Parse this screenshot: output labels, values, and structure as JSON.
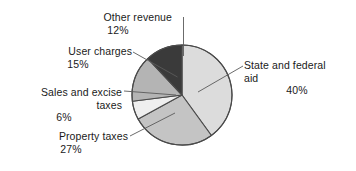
{
  "chart_data": {
    "type": "pie",
    "title": "",
    "subtitle": "",
    "xlabel": "",
    "ylabel": "",
    "legend_position": "none",
    "labels_position": "outside-with-leader-lines",
    "start_angle_deg": 0,
    "direction": "clockwise",
    "units": "percent",
    "categories": [
      "State and federal aid",
      "Property taxes",
      "Sales and excise taxes",
      "User charges",
      "Other revenue"
    ],
    "values": [
      40,
      27,
      6,
      15,
      12
    ],
    "slices": [
      {
        "name": "State and federal aid",
        "name_line1": "State and federal",
        "name_line2": "aid",
        "value": 40,
        "value_text": "40%",
        "color": "#dcdcdc",
        "start_deg": 0,
        "end_deg": 144
      },
      {
        "name": "Property taxes",
        "name_line1": "Property taxes",
        "name_line2": "",
        "value": 27,
        "value_text": "27%",
        "color": "#c4c4c4",
        "start_deg": 144,
        "end_deg": 241.2
      },
      {
        "name": "Sales and excise taxes",
        "name_line1": "Sales and excise",
        "name_line2": "taxes",
        "value": 6,
        "value_text": "6%",
        "color": "#efefef",
        "start_deg": 241.2,
        "end_deg": 262.8
      },
      {
        "name": "User charges",
        "name_line1": "User charges",
        "name_line2": "",
        "value": 15,
        "value_text": "15%",
        "color": "#b4b4b4",
        "start_deg": 262.8,
        "end_deg": 316.8
      },
      {
        "name": "Other revenue",
        "name_line1": "Other revenue",
        "name_line2": "",
        "value": 12,
        "value_text": "12%",
        "color": "#3a3a3a",
        "start_deg": 316.8,
        "end_deg": 360
      }
    ]
  },
  "colors": {
    "background": "#ffffff",
    "text": "#1a1a1a",
    "outline": "#4a4a4a",
    "leader_line": "#5a5a5a",
    "state_and_federal_aid": "#dcdcdc",
    "property_taxes": "#c4c4c4",
    "sales_and_excise_taxes": "#efefef",
    "user_charges": "#b4b4b4",
    "other_revenue": "#3a3a3a"
  }
}
